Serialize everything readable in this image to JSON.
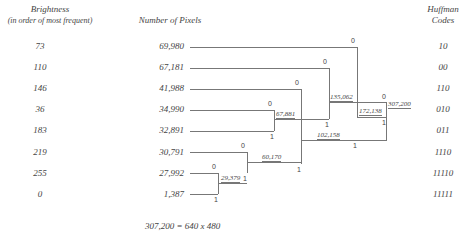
{
  "headers": {
    "brightness_title": "Brightness",
    "brightness_sub": "(in order of most frequent)",
    "pixels": "Number of Pixels",
    "codes_line1": "Huffman",
    "codes_line2": "Codes"
  },
  "rows": [
    {
      "brightness": "73",
      "pixels": "69,980",
      "code": "10"
    },
    {
      "brightness": "110",
      "pixels": "67,181",
      "code": "00"
    },
    {
      "brightness": "146",
      "pixels": "41,988",
      "code": "110"
    },
    {
      "brightness": "36",
      "pixels": "34,990",
      "code": "010"
    },
    {
      "brightness": "183",
      "pixels": "32,891",
      "code": "011"
    },
    {
      "brightness": "219",
      "pixels": "30,791",
      "code": "1110"
    },
    {
      "brightness": "255",
      "pixels": "27,992",
      "code": "11110"
    },
    {
      "brightness": "0",
      "pixels": "1,387",
      "code": "11111"
    }
  ],
  "nodes": {
    "n29379": "29,379",
    "n60170": "60,170",
    "n67881": "67,881",
    "n102158": "102,158",
    "n135062": "135,062",
    "n172138": "172,138",
    "n307200": "307,200"
  },
  "bits": {
    "zero": "0",
    "one": "1"
  },
  "footer": "307,200 = 640 x 480"
}
